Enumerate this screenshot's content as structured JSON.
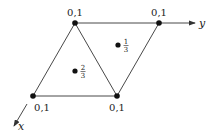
{
  "diagram": {
    "vertices": [
      {
        "id": "top-left",
        "x": 75,
        "y": 23,
        "label": "0,1",
        "lx": 75,
        "ly": 16
      },
      {
        "id": "top-right",
        "x": 159,
        "y": 23,
        "label": "0,1",
        "lx": 159,
        "ly": 16
      },
      {
        "id": "bottom-left",
        "x": 33,
        "y": 96,
        "label": "0,1",
        "lx": 42,
        "ly": 111
      },
      {
        "id": "bottom-right",
        "x": 117,
        "y": 96,
        "label": "0,1",
        "lx": 117,
        "ly": 111
      }
    ],
    "interior_points": [
      {
        "id": "upper-triangle-point",
        "x": 118,
        "y": 45,
        "num": "1",
        "den": "3"
      },
      {
        "id": "lower-triangle-point",
        "x": 75,
        "y": 71,
        "num": "2",
        "den": "3"
      }
    ],
    "axes": {
      "y_label": "y",
      "x_label": "x"
    },
    "colors": {
      "line": "#333333",
      "point": "#111111"
    }
  }
}
